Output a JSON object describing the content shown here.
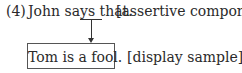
{
  "example": {
    "number": "(4)",
    "sentence": "John says that.",
    "sentence_label": "[assertive component]",
    "display_sample": "Tom is a fool.",
    "display_label": "[display sample]"
  }
}
